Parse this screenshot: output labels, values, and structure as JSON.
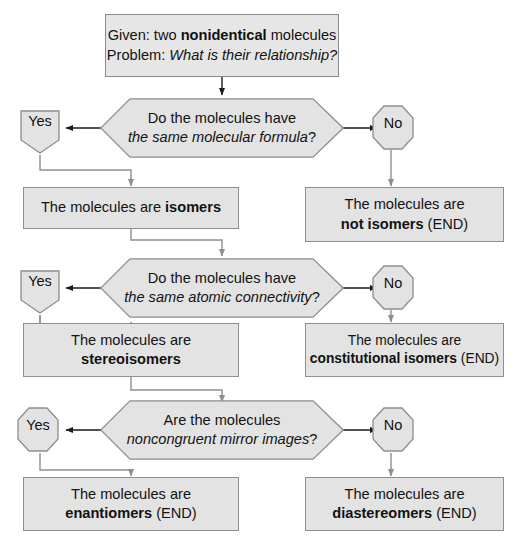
{
  "diagram": {
    "colors": {
      "node_fill": "#e3e3e3",
      "node_stroke": "#8e8e8e",
      "wire": "#8e8e8e",
      "arrow_dark": "#1a1a1a",
      "text": "#121212",
      "background": "#ffffff"
    }
  },
  "start": {
    "line1_label": "Given:",
    "line1_rest_a": " two ",
    "line1_bold": "nonidentical",
    "line1_rest_b": " molecules",
    "line2_label": "Problem:",
    "line2_italic": " What is their relationship?"
  },
  "decisions": [
    {
      "id": "decision-molecular-formula",
      "line1": "Do the molecules have",
      "line2_italic": "the same molecular formula",
      "line2_tail": "?",
      "yes_label": "Yes",
      "no_label": "No"
    },
    {
      "id": "decision-atomic-connectivity",
      "line1": "Do the molecules have",
      "line2_italic": "the same atomic connectivity",
      "line2_tail": "?",
      "yes_label": "Yes",
      "no_label": "No"
    },
    {
      "id": "decision-mirror-images",
      "line1": "Are the molecules",
      "line2_italic": "noncongruent mirror images",
      "line2_tail": "?",
      "yes_label": "Yes",
      "no_label": "No"
    }
  ],
  "results": {
    "isomers": {
      "prefix": "The molecules are ",
      "bold": "isomers",
      "suffix": ""
    },
    "not_isomers": {
      "prefix": "The molecules are",
      "bold": "not isomers",
      "suffix": " (END)"
    },
    "stereoisomers": {
      "prefix": "The molecules are",
      "bold": "stereoisomers",
      "suffix": ""
    },
    "constitutional_isomers": {
      "prefix": "The molecules are",
      "bold": "constitutional isomers",
      "suffix": " (END)"
    },
    "enantiomers": {
      "prefix": "The molecules are",
      "bold": "enantiomers",
      "suffix": " (END)"
    },
    "diastereomers": {
      "prefix": "The molecules are",
      "bold": "diastereomers",
      "suffix": " (END)"
    }
  }
}
